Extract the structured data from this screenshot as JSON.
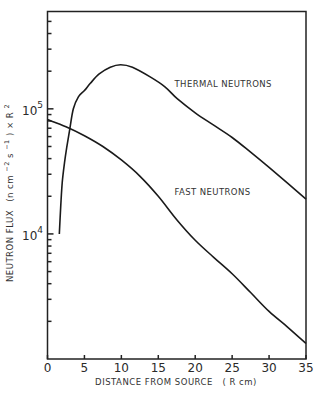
{
  "chart_data": {
    "type": "line",
    "title": "",
    "xlabel": "DISTANCE FROM SOURCE   ( R cm)",
    "ylabel": "NEUTRON FLUX  (n cm⁻² s⁻¹) × R²",
    "ylabel_parts": {
      "main": "NEUTRON FLUX",
      "units_open": "(n cm",
      "sup1": "−2",
      "mid": " s",
      "sup2": "−1",
      "units_close": ") × R",
      "sup3": "2"
    },
    "xscale": "linear",
    "yscale": "log",
    "xlim": [
      0,
      35
    ],
    "ylim": [
      1000,
      600000
    ],
    "xticks": [
      0,
      5,
      10,
      15,
      20,
      25,
      30,
      35
    ],
    "xtick_labels": [
      "0",
      "5",
      "10",
      "15",
      "20",
      "25",
      "30",
      "35"
    ],
    "yticks_major": [
      10000,
      100000
    ],
    "ytick_labels": [
      {
        "base": "10",
        "exp": "4"
      },
      {
        "base": "10",
        "exp": "5"
      }
    ],
    "yticks_minor": [
      2000,
      3000,
      4000,
      5000,
      6000,
      7000,
      8000,
      9000,
      20000,
      30000,
      40000,
      50000,
      60000,
      70000,
      80000,
      90000,
      200000,
      300000,
      400000,
      500000
    ],
    "grid": false,
    "legend": "none",
    "series": [
      {
        "name": "THERMAL NEUTRONS",
        "x": [
          1.6,
          1.8,
          2.0,
          2.3,
          2.6,
          3.0,
          3.5,
          4.2,
          5.0,
          5.8,
          7.0,
          8.5,
          9.9,
          11.5,
          13.9,
          15.9,
          17.6,
          20,
          22.5,
          25,
          27.5,
          30,
          32.5,
          35
        ],
        "y": [
          10000,
          17000,
          26000,
          37000,
          49000,
          68000,
          100000,
          125000,
          140000,
          160000,
          190000,
          215000,
          225000,
          215000,
          180000,
          150000,
          120000,
          93000,
          74000,
          59000,
          45000,
          34000,
          25500,
          19000
        ]
      },
      {
        "name": "FAST NEUTRONS",
        "x": [
          0,
          2.5,
          5,
          7.5,
          10,
          12.5,
          15,
          17.5,
          20,
          22.5,
          25,
          27.5,
          30,
          32.5,
          35
        ],
        "y": [
          82000,
          72000,
          61000,
          50000,
          39000,
          29000,
          20000,
          13000,
          8900,
          6500,
          4800,
          3400,
          2400,
          1800,
          1330
        ]
      }
    ],
    "annotations": [
      {
        "text": "THERMAL NEUTRONS",
        "x": 17.2,
        "y": 150000
      },
      {
        "text": "FAST NEUTRONS",
        "x": 17.2,
        "y": 20500
      }
    ]
  }
}
